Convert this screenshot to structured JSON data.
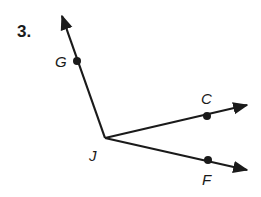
{
  "problem": {
    "number": "3."
  },
  "diagram": {
    "vertex": {
      "label": "J",
      "x": 105,
      "y": 138
    },
    "rays": [
      {
        "name": "ray-JG",
        "point_label": "G",
        "point": [
          77,
          61
        ],
        "tip": [
          62,
          15
        ]
      },
      {
        "name": "ray-JC",
        "point_label": "C",
        "point": [
          207,
          116
        ],
        "tip": [
          248,
          105
        ]
      },
      {
        "name": "ray-JF",
        "point_label": "F",
        "point": [
          208,
          160
        ],
        "tip": [
          248,
          170
        ]
      }
    ],
    "color": "#1a1a1a"
  }
}
